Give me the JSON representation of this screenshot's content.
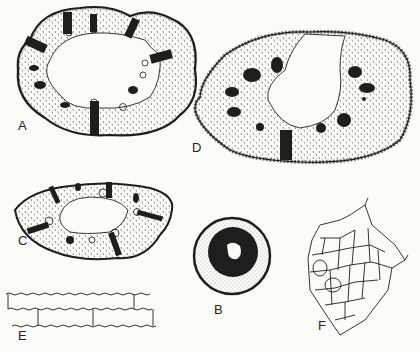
{
  "plate": {
    "background": "#fbfbfa",
    "ink": "#1e1e1e",
    "figures": [
      {
        "id": "A",
        "label": "A",
        "kind": "hollow-stem-cross-section",
        "label_pos": [
          18,
          125
        ]
      },
      {
        "id": "B",
        "label": "B",
        "kind": "solid-root-cross-section",
        "label_pos": [
          214,
          310
        ]
      },
      {
        "id": "C",
        "label": "C",
        "kind": "hollow-stem-cross-section",
        "label_pos": [
          18,
          240
        ]
      },
      {
        "id": "D",
        "label": "D",
        "kind": "hollow-stem-cross-section",
        "label_pos": [
          192,
          145
        ]
      },
      {
        "id": "E",
        "label": "E",
        "kind": "epidermis-cells-wavy-walls",
        "label_pos": [
          18,
          335
        ]
      },
      {
        "id": "F",
        "label": "F",
        "kind": "parenchyma-cell-network",
        "label_pos": [
          318,
          325
        ]
      }
    ]
  }
}
